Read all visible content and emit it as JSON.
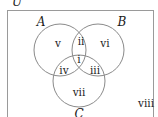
{
  "diagram": {
    "type": "venn-3-set",
    "universe_label": "U",
    "sets": [
      {
        "label": "A",
        "cx": 60,
        "cy": 50,
        "r": 26,
        "label_x": 41,
        "label_y": 25
      },
      {
        "label": "B",
        "cx": 98,
        "cy": 50,
        "r": 26,
        "label_x": 122,
        "label_y": 25
      },
      {
        "label": "C",
        "cx": 79,
        "cy": 81,
        "r": 26,
        "label_x": 79,
        "label_y": 117
      }
    ],
    "regions": [
      {
        "id": "i",
        "label": "i",
        "x": 79,
        "y": 62
      },
      {
        "id": "ii",
        "label": "ii",
        "x": 81,
        "y": 44
      },
      {
        "id": "iii",
        "label": "iii",
        "x": 94,
        "y": 73
      },
      {
        "id": "iv",
        "label": "iv",
        "x": 64,
        "y": 73
      },
      {
        "id": "v",
        "label": "v",
        "x": 58,
        "y": 46
      },
      {
        "id": "vi",
        "label": "vi",
        "x": 105,
        "y": 46
      },
      {
        "id": "vii",
        "label": "vii",
        "x": 79,
        "y": 95
      },
      {
        "id": "viii",
        "label": "viii",
        "x": 146,
        "y": 106
      }
    ],
    "colors": {
      "circle_stroke": "#8a8a8a",
      "rect_stroke": "#9a9a9a",
      "text": "#1a1a1a"
    }
  }
}
